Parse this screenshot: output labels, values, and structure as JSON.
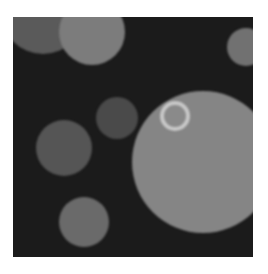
{
  "image": {
    "description": "Grayscale microscopy-style image of circular blobs on a dark background",
    "background_color": "#1b1b1b",
    "frame": {
      "x": 13,
      "y": 17,
      "width": 240,
      "height": 240
    },
    "blobs": [
      {
        "id": "top-left-faint",
        "cx": 30,
        "cy": -5,
        "r": 42,
        "color": "#5a5a5a",
        "edge": "#2a2a2a"
      },
      {
        "id": "top-center",
        "cx": 79,
        "cy": 15,
        "r": 33,
        "color": "#7c7c7c",
        "edge": "#3c3c3c"
      },
      {
        "id": "right-edge",
        "cx": 233,
        "cy": 30,
        "r": 19,
        "color": "#717171",
        "edge": "#383838"
      },
      {
        "id": "middle-small",
        "cx": 104,
        "cy": 101,
        "r": 21,
        "color": "#4a4a4a",
        "edge": "#333333"
      },
      {
        "id": "left-medium",
        "cx": 51,
        "cy": 131,
        "r": 28,
        "color": "#555555",
        "edge": "#363636"
      },
      {
        "id": "large-right",
        "cx": 190,
        "cy": 145,
        "r": 71,
        "color": "#858585",
        "edge": "#404040"
      },
      {
        "id": "bottom-left",
        "cx": 71,
        "cy": 205,
        "r": 25,
        "color": "#6a6a6a",
        "edge": "#383838"
      }
    ],
    "rings": [
      {
        "id": "bright-ring",
        "cx": 162,
        "cy": 99,
        "r": 15,
        "stroke": 4,
        "color": "#c8c8c8",
        "fill": "#8a8a8a"
      }
    ]
  }
}
